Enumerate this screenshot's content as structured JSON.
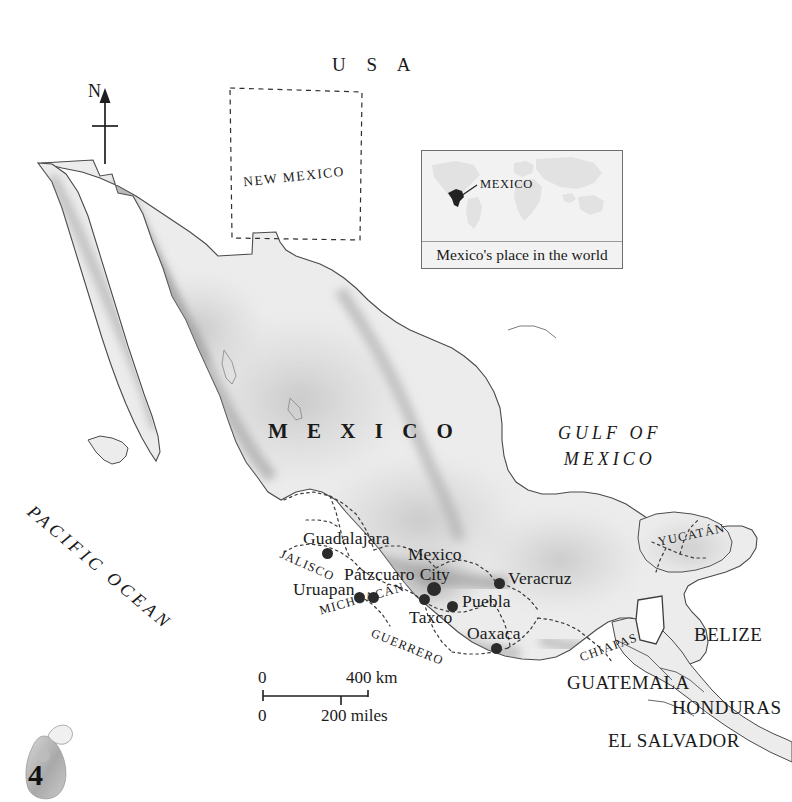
{
  "page": {
    "number": "4",
    "ornament_icon": "sculpture-ornament-icon"
  },
  "north_arrow": {
    "label": "N",
    "icon": "north-arrow-icon"
  },
  "countries": {
    "usa": "U S A",
    "mexico": "M E X I C O",
    "belize": "BELIZE",
    "guatemala": "GUATEMALA",
    "honduras": "HONDURAS",
    "el_salvador": "EL SALVADOR"
  },
  "water_bodies": {
    "pacific_ocean": "PACIFIC OCEAN",
    "gulf_line1": "GULF OF",
    "gulf_line2": "MEXICO"
  },
  "states": {
    "new_mexico": "NEW MEXICO",
    "jalisco": "JALISCO",
    "michoacan": "MICHOACÁN",
    "guerrero": "GUERRERO",
    "chiapas": "CHIAPAS",
    "yucatan": "YUCATÁN"
  },
  "cities": [
    {
      "name": "Guadalajara",
      "dot": "city-dot"
    },
    {
      "name": "Pátzcuaro",
      "dot": "city-dot"
    },
    {
      "name": "Uruapan",
      "dot": "city-dot"
    },
    {
      "name": "Mexico City",
      "line1": "Mexico",
      "line2": "City",
      "dot": "capital-dot"
    },
    {
      "name": "Veracruz",
      "dot": "city-dot"
    },
    {
      "name": "Puebla",
      "dot": "city-dot"
    },
    {
      "name": "Taxco",
      "dot": "city-dot"
    },
    {
      "name": "Oaxaca",
      "dot": "city-dot"
    }
  ],
  "inset": {
    "label": "MEXICO",
    "caption": "Mexico's place in the world"
  },
  "scale_bar": {
    "km_zero": "0",
    "km_max": "400 km",
    "miles_zero": "0",
    "miles_max": "200 miles"
  },
  "colors": {
    "land": "#ececec",
    "outline": "#555555",
    "terrain_dark": "#8d8d8d",
    "text": "#1a1a1a",
    "inset_bg": "#f2f2f2"
  }
}
